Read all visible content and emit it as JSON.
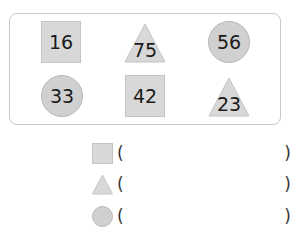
{
  "shapes": [
    {
      "type": "square",
      "value": "16"
    },
    {
      "type": "triangle",
      "value": "75"
    },
    {
      "type": "circle",
      "value": "56"
    },
    {
      "type": "circle",
      "value": "33"
    },
    {
      "type": "square",
      "value": "42"
    },
    {
      "type": "triangle",
      "value": "23"
    }
  ],
  "legend": [
    {
      "shape": "square",
      "open": "(",
      "answer": "",
      "close": ")"
    },
    {
      "shape": "triangle",
      "open": "(",
      "answer": "",
      "close": ")"
    },
    {
      "shape": "circle",
      "open": "(",
      "answer": "",
      "close": ")"
    }
  ],
  "colors": {
    "shape_fill": "#d8d8d8",
    "circle_fill": "#d0d0d0",
    "panel_border": "#c8c8c8"
  }
}
